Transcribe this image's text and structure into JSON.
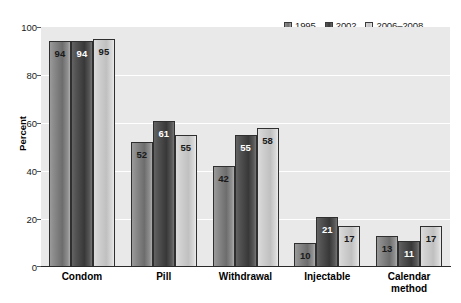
{
  "chart_data": {
    "type": "bar",
    "title": "",
    "xlabel": "",
    "ylabel": "Percent",
    "ylim": [
      0,
      100
    ],
    "yticks": [
      0,
      20,
      40,
      60,
      80,
      100
    ],
    "ytick_labels": [
      "0",
      "20",
      "40",
      "60",
      "80",
      "100"
    ],
    "grid": "horizontal-white",
    "legend_position": "top-right",
    "categories": [
      "Condom",
      "Pill",
      "Withdrawal",
      "Injectable",
      "Calendar method"
    ],
    "series": [
      {
        "name": "1995",
        "color": "#6d6d6d",
        "values": [
          94,
          52,
          42,
          10,
          13
        ]
      },
      {
        "name": "2002",
        "color": "#383838",
        "values": [
          94,
          61,
          55,
          21,
          11
        ]
      },
      {
        "name": "2006-2008",
        "color": "#c0c0c0",
        "values": [
          95,
          55,
          58,
          17,
          17
        ]
      }
    ],
    "data_labels": [
      [
        "94",
        "94",
        "95"
      ],
      [
        "52",
        "61",
        "55"
      ],
      [
        "42",
        "55",
        "58"
      ],
      [
        "10",
        "21",
        "17"
      ],
      [
        "13",
        "11",
        "17"
      ]
    ]
  },
  "legend": {
    "items": [
      {
        "label": "1995"
      },
      {
        "label": "2002"
      },
      {
        "label": "2006–2008"
      }
    ]
  },
  "axes": {
    "y_title": "Percent",
    "y_ticks": [
      "100",
      "80",
      "60",
      "40",
      "20",
      "0"
    ],
    "x_categories": [
      {
        "line1": "Condom",
        "line2": ""
      },
      {
        "line1": "Pill",
        "line2": ""
      },
      {
        "line1": "Withdrawal",
        "line2": ""
      },
      {
        "line1": "Injectable",
        "line2": ""
      },
      {
        "line1": "Calendar",
        "line2": "method"
      }
    ]
  }
}
